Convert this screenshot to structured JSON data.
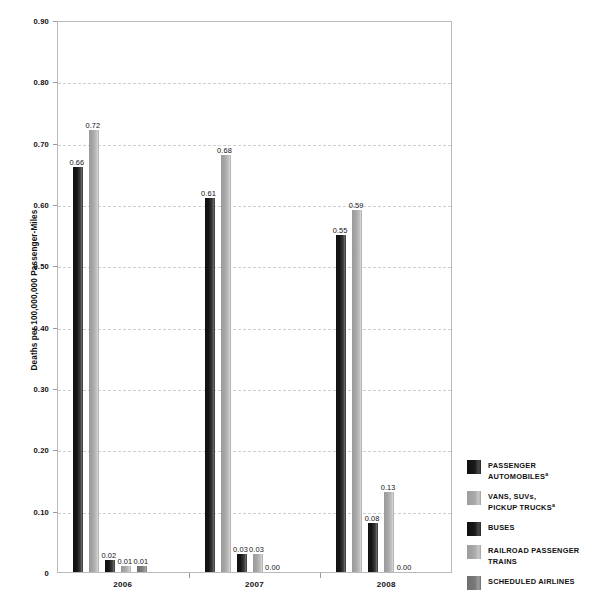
{
  "chart_data": {
    "type": "bar",
    "title": "",
    "xlabel": "",
    "ylabel": "Deaths per 100,000,000 Passenger-Miles",
    "ylim": [
      0,
      0.9
    ],
    "grid": true,
    "legend_position": "right",
    "categories": [
      "2006",
      "2007",
      "2008"
    ],
    "y_ticks": [
      "0",
      "0.10",
      "0.20",
      "0.30",
      "0.40",
      "0.50",
      "0.60",
      "0.70",
      "0.80",
      "0.90"
    ],
    "series": [
      {
        "name": "PASSENGER AUTOMOBILES",
        "footnote": "a",
        "color": "#1a1a1a",
        "tone": "dark",
        "values": [
          0.66,
          0.61,
          0.55
        ],
        "labels": [
          "0.66",
          "0.61",
          "0.55"
        ]
      },
      {
        "name": "VANS, SUVs, PICKUP TRUCKS",
        "footnote": "a",
        "color": "#b0b0b0",
        "tone": "light",
        "values": [
          0.72,
          0.68,
          0.59
        ],
        "labels": [
          "0.72",
          "0.68",
          "0.59"
        ]
      },
      {
        "name": "BUSES",
        "footnote": "",
        "color": "#1a1a1a",
        "tone": "dark",
        "values": [
          0.02,
          0.03,
          0.08
        ],
        "labels": [
          "0.02",
          "0.03",
          "0.08"
        ]
      },
      {
        "name": "RAILROAD PASSENGER TRAINS",
        "footnote": "",
        "color": "#b0b0b0",
        "tone": "light",
        "values": [
          0.01,
          0.03,
          0.13
        ],
        "labels": [
          "0.01",
          "0.03",
          "0.13"
        ]
      },
      {
        "name": "SCHEDULED AIRLINES",
        "footnote": "",
        "color": "#7a7a7a",
        "tone": "mid",
        "values": [
          0.01,
          0.0,
          0.0
        ],
        "labels": [
          "0.01",
          "0.00",
          "0.00"
        ]
      }
    ]
  },
  "legend": {
    "items": [
      {
        "line1": "PASSENGER",
        "line2": "AUTOMOBILES",
        "sup": "a",
        "tone": "dark"
      },
      {
        "line1": "VANS, SUVs,",
        "line2": "PICKUP TRUCKS",
        "sup": "a",
        "tone": "light"
      },
      {
        "line1": "BUSES",
        "line2": "",
        "sup": "",
        "tone": "dark"
      },
      {
        "line1": "RAILROAD PASSENGER",
        "line2": "TRAINS",
        "sup": "",
        "tone": "light"
      },
      {
        "line1": "SCHEDULED AIRLINES",
        "line2": "",
        "sup": "",
        "tone": "mid"
      }
    ]
  }
}
